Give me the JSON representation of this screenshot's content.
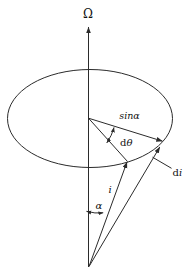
{
  "figure": {
    "labels": {
      "omega": "Ω",
      "sin_alpha": "sinα",
      "dtheta": {
        "prefix": "d",
        "symbol": "θ"
      },
      "di": {
        "prefix": "d",
        "symbol": "i"
      },
      "i": "i",
      "alpha": "α"
    },
    "colors": {
      "line": "#2b2b2b",
      "text": "#111111",
      "background": "#ffffff"
    }
  }
}
